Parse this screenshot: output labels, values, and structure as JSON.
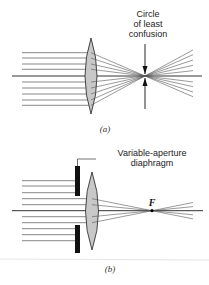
{
  "figure": {
    "panel_a": {
      "caption": "(a)",
      "annotation_lines": [
        "Circle",
        "of least",
        "confusion"
      ],
      "incoming_rays_y": [
        52.7,
        58,
        64,
        69.3,
        82,
        88,
        94,
        100,
        105.3
      ],
      "ray_start_x": 22,
      "axis": {
        "y": 76,
        "x1": 12,
        "x2": 202
      },
      "lens": {
        "cx": 91,
        "top": 38,
        "bottom": 114,
        "half_width": 6
      },
      "focus": {
        "x": 145,
        "y": 76
      },
      "ray_end_x": 193,
      "arrow": {
        "x": 145,
        "top": 44,
        "bottom": 109
      }
    },
    "panel_b": {
      "caption": "(b)",
      "annotation_lines": [
        "Variable-aperture",
        "diaphragm"
      ],
      "focal_label": "F",
      "blocked_rays_y": [
        180.7,
        186,
        192.7,
        228.7,
        234.7,
        240.7
      ],
      "passing_rays_y": [
        198.7,
        204.7,
        216.7,
        222.7
      ],
      "ray_start_x": 22,
      "axis": {
        "y": 210.7,
        "x1": 12,
        "x2": 203
      },
      "lens": {
        "cx": 92,
        "top": 172,
        "bottom": 250,
        "half_width": 6.5
      },
      "diaphragm": {
        "x": 75,
        "width": 5,
        "top_bar": [
          166,
          196
        ],
        "bottom_bar": [
          225,
          253
        ]
      },
      "focus": {
        "x": 152,
        "y": 210.7
      },
      "ray_end_x": 193
    },
    "colors": {
      "lens_fill": "#c8c8c8",
      "ray": "#555555",
      "axis": "#333333",
      "diaphragm": "#111111",
      "divider": "#dddddd"
    }
  }
}
